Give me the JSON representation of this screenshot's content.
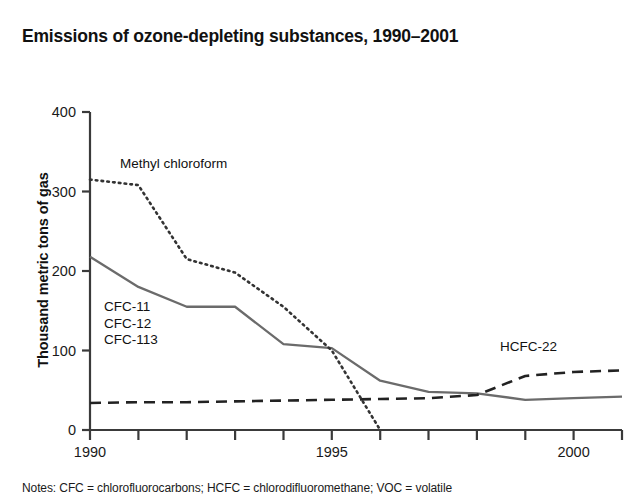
{
  "chart_data": {
    "type": "line",
    "title": "Emissions of ozone-depleting substances, 1990–2001",
    "xlabel": "",
    "ylabel": "Thousand metric tons of gas",
    "xlim": [
      1990,
      2001
    ],
    "ylim": [
      0,
      400
    ],
    "grid": false,
    "legend": "inline-annotations",
    "x_ticks_major": [
      "1990",
      "1995",
      "2000"
    ],
    "x_ticks_major_values": [
      1990,
      1995,
      2000
    ],
    "x_ticks_minor_values": [
      1991,
      1992,
      1993,
      1994,
      1996,
      1997,
      1998,
      1999,
      2001
    ],
    "y_ticks": [
      "0",
      "100",
      "200",
      "300",
      "400"
    ],
    "y_tick_values": [
      0,
      100,
      200,
      300,
      400
    ],
    "x": [
      1990,
      1991,
      1992,
      1993,
      1994,
      1995,
      1996,
      1997,
      1998,
      1999,
      2000,
      2001
    ],
    "series": [
      {
        "name": "Methyl chloroform",
        "style": "dotted",
        "color": "#333333",
        "x": [
          1990,
          1991,
          1992,
          1993,
          1994,
          1995,
          1996
        ],
        "values": [
          315,
          308,
          215,
          198,
          155,
          100,
          0
        ]
      },
      {
        "name": "CFC-11\nCFC-12\nCFC-113",
        "label_lines": [
          "CFC-11",
          "CFC-12",
          "CFC-113"
        ],
        "style": "solid",
        "color": "#6b6b6b",
        "x": [
          1990,
          1991,
          1992,
          1993,
          1994,
          1995,
          1996,
          1997,
          1998,
          1999,
          2000,
          2001
        ],
        "values": [
          218,
          180,
          155,
          155,
          108,
          103,
          62,
          48,
          46,
          38,
          40,
          42
        ]
      },
      {
        "name": "HCFC-22",
        "style": "dashed",
        "color": "#222222",
        "x": [
          1990,
          1991,
          1992,
          1993,
          1994,
          1995,
          1996,
          1997,
          1998,
          1999,
          2000,
          2001
        ],
        "values": [
          34,
          35,
          35,
          36,
          37,
          38,
          39,
          40,
          44,
          68,
          73,
          75
        ]
      }
    ],
    "annotations": [
      {
        "text": "Methyl chloroform",
        "x": 1991.1,
        "y": 345
      },
      {
        "text": "CFC-11",
        "x": 1990.4,
        "y": 147
      },
      {
        "text": "CFC-12",
        "x": 1990.4,
        "y": 127
      },
      {
        "text": "CFC-113",
        "x": 1990.4,
        "y": 107
      },
      {
        "text": "HCFC-22",
        "x": 1999.0,
        "y": 103
      }
    ]
  },
  "note": "Notes: CFC = chlorofluorocarbons; HCFC = chlorodifluoromethane; VOC = volatile"
}
